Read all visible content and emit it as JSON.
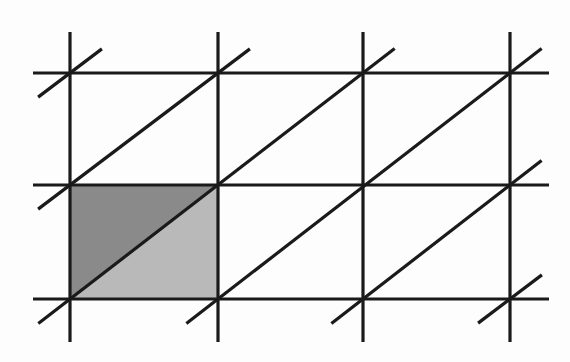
{
  "figure": {
    "background_color": "#fdfdfd",
    "line_color": "#1a1a1a",
    "grid_line_width": 3.2,
    "diagonal_line_width": 3.2,
    "shading": {
      "dark_triangle_color": "#8a8a8a",
      "light_triangle_color": "#b9b9b9"
    },
    "geometry": {
      "vertical_lines_x": [
        70,
        218,
        363,
        510
      ],
      "horizontal_lines_y": [
        73,
        185,
        299
      ],
      "vertical_extent_y": [
        32,
        342
      ],
      "horizontal_extent_x": [
        33,
        549
      ],
      "shaded_cell": {
        "x0": 70,
        "y0": 185,
        "x1": 218,
        "y1": 299
      },
      "diagonal_overhang": 40,
      "diagonals_through_points": [
        [
          [
            70,
            299
          ],
          [
            218,
            185
          ],
          [
            363,
            73
          ]
        ],
        [
          [
            218,
            299
          ],
          [
            363,
            185
          ],
          [
            510,
            73
          ]
        ],
        [
          [
            363,
            299
          ],
          [
            510,
            185
          ]
        ],
        [
          [
            510,
            299
          ]
        ],
        [
          [
            70,
            185
          ],
          [
            218,
            73
          ]
        ],
        [
          [
            70,
            73
          ]
        ]
      ]
    }
  }
}
